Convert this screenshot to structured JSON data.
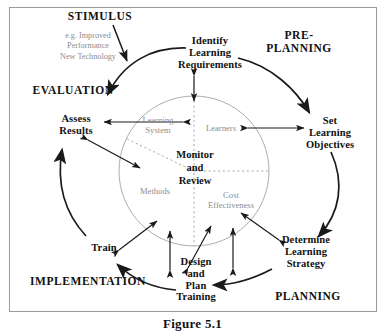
{
  "figure": {
    "caption": "Figure 5.1",
    "border_color": "#9a9a9a",
    "background": "#ffffff"
  },
  "colors": {
    "ink": "#111111",
    "grey_text": "#8d8d8d",
    "circle_stroke": "#9a9a9a",
    "arrow": "#1a1a1a"
  },
  "phases": [
    {
      "id": "stimulus",
      "label": "STIMULUS",
      "x": 100,
      "y": 16
    },
    {
      "id": "pre-planning",
      "label": "PRE-PLANNING",
      "x": 299,
      "y": 42
    },
    {
      "id": "evaluation",
      "label": "EVALUATION",
      "x": 73,
      "y": 90
    },
    {
      "id": "planning",
      "label": "PLANNING",
      "x": 308,
      "y": 296
    },
    {
      "id": "implementation",
      "label": "IMPLEMENTATION",
      "x": 88,
      "y": 281
    }
  ],
  "stimulus_note": {
    "id": "stimulus-examples",
    "lines": "e.g. Improved\nPerformance\nNew Technology",
    "x": 88,
    "y": 46
  },
  "nodes": [
    {
      "id": "identify-learning-requirements",
      "label": "Identify\nLearning\nRequirements",
      "x": 210,
      "y": 53
    },
    {
      "id": "set-learning-objectives",
      "label": "Set\nLearning\nObjectives",
      "x": 330,
      "y": 133
    },
    {
      "id": "determine-learning-strategy",
      "label": "Determine\nLearning\nStrategy",
      "x": 306,
      "y": 252
    },
    {
      "id": "design-and-plan-training",
      "label": "Design\nand\nPlan\nTraining",
      "x": 196,
      "y": 279
    },
    {
      "id": "train",
      "label": "Train",
      "x": 104,
      "y": 248
    },
    {
      "id": "assess-results",
      "label": "Assess\nResults",
      "x": 76,
      "y": 125
    }
  ],
  "circle": {
    "cx": 194,
    "cy": 171,
    "r": 75,
    "center_label": "Monitor\nand\nReview",
    "quadrants": [
      {
        "id": "learning-system",
        "label": "Learning\nSystem",
        "x": 158,
        "y": 125
      },
      {
        "id": "learners",
        "label": "Learners",
        "x": 221,
        "y": 128
      },
      {
        "id": "methods",
        "label": "Methods",
        "x": 155,
        "y": 191
      },
      {
        "id": "cost-effectiveness",
        "label": "Cost\nEffectiveness",
        "x": 231,
        "y": 200
      }
    ]
  }
}
